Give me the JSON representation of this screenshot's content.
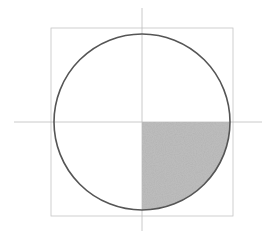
{
  "diagram": {
    "type": "circle-quadrant-sketch",
    "canvas": {
      "width": 276,
      "height": 231,
      "background": "#ffffff"
    },
    "circle": {
      "cx": 142,
      "cy": 122,
      "r": 88,
      "stroke": "#555555",
      "stroke_width": 1.6
    },
    "square": {
      "x": 51,
      "y": 28,
      "width": 182,
      "height": 188,
      "stroke": "#c4c4c4",
      "stroke_width": 0.8
    },
    "horizontal_axis": {
      "x1": 14,
      "y1": 122,
      "x2": 262,
      "y2": 122,
      "stroke": "#bdbdbd"
    },
    "vertical_axis": {
      "x1": 142,
      "y1": 8,
      "x2": 142,
      "y2": 231,
      "stroke": "#bdbdbd"
    },
    "shaded_quadrant": {
      "position": "lower-right",
      "fill": "#bcbcbc",
      "texture": "pencil-grain"
    }
  }
}
